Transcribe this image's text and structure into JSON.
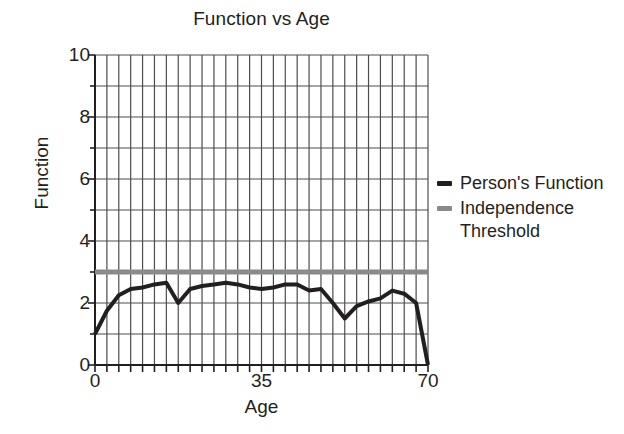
{
  "chart_data": {
    "type": "line",
    "title": "Function vs Age",
    "xlabel": "Age",
    "ylabel": "Function",
    "xlim": [
      0,
      70
    ],
    "ylim": [
      0,
      10
    ],
    "grid": true,
    "x_tick_labels": [
      "0",
      "35",
      "70"
    ],
    "x_tick_values": [
      0,
      35,
      70
    ],
    "y_tick_labels": [
      "0",
      "2",
      "4",
      "6",
      "8",
      "10"
    ],
    "y_tick_values": [
      0,
      2,
      4,
      6,
      8,
      10
    ],
    "y_gridline_values": [
      0,
      1,
      2,
      3,
      4,
      5,
      6,
      7,
      8,
      9,
      10
    ],
    "x_gridline_step": 2.5,
    "legend_position": "right",
    "series": [
      {
        "name": "Person's Function",
        "color": "#231f20",
        "linewidth": 4,
        "x": [
          0,
          2.5,
          5,
          7.5,
          10,
          12.5,
          15,
          17.5,
          20,
          22.5,
          25,
          27.5,
          30,
          32.5,
          35,
          37.5,
          40,
          42.5,
          45,
          47.5,
          50,
          52.5,
          55,
          57.5,
          60,
          62.5,
          65,
          67.5,
          70
        ],
        "values": [
          1.0,
          1.75,
          2.25,
          2.45,
          2.5,
          2.6,
          2.65,
          2.0,
          2.45,
          2.55,
          2.6,
          2.65,
          2.6,
          2.5,
          2.45,
          2.5,
          2.6,
          2.6,
          2.4,
          2.45,
          2.0,
          1.5,
          1.9,
          2.05,
          2.15,
          2.4,
          2.3,
          2.0,
          0.0
        ]
      },
      {
        "name": "Independence Threshold",
        "color": "#8a8a8a",
        "linewidth": 5,
        "x": [
          0,
          70
        ],
        "values": [
          3.0,
          3.0
        ]
      }
    ]
  },
  "legend": {
    "entries": [
      {
        "label": "Person's Function",
        "color": "#231f20"
      },
      {
        "label": "Independence Threshold",
        "color": "#8a8a8a"
      }
    ]
  }
}
